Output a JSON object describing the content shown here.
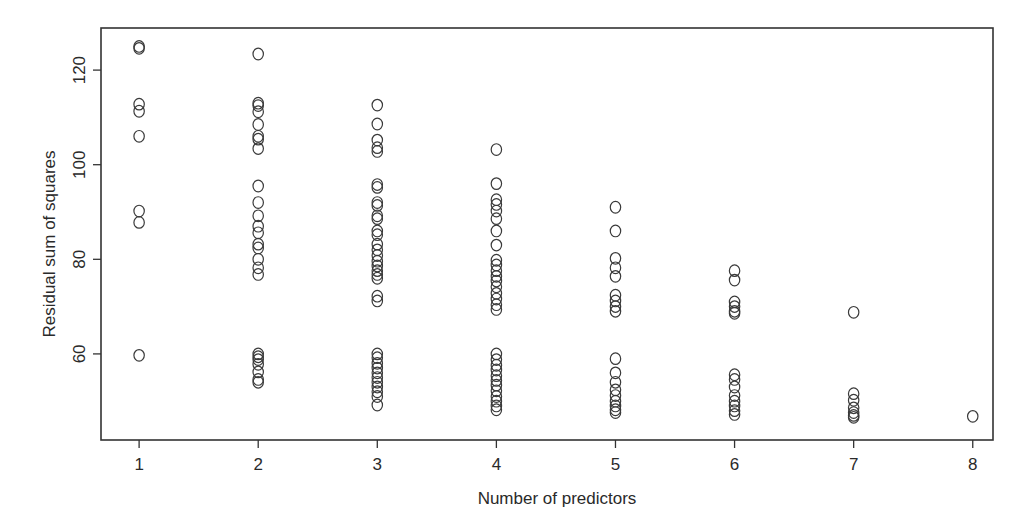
{
  "chart_data": {
    "type": "scatter",
    "title": "",
    "xlabel": "Number of predictors",
    "ylabel": "Residual sum of squares",
    "xlim": [
      0.68,
      8.17
    ],
    "ylim": [
      41.8,
      128.9
    ],
    "xticks": [
      1,
      2,
      3,
      4,
      5,
      6,
      7,
      8
    ],
    "yticks": [
      60,
      80,
      100,
      120
    ],
    "grid": false,
    "legend": "none",
    "marker": "open-circle",
    "series": [
      {
        "name": "models",
        "points": [
          {
            "x": 1,
            "y": 125.0
          },
          {
            "x": 1,
            "y": 124.6
          },
          {
            "x": 1,
            "y": 112.8
          },
          {
            "x": 1,
            "y": 111.3
          },
          {
            "x": 1,
            "y": 106.0
          },
          {
            "x": 1,
            "y": 90.2
          },
          {
            "x": 1,
            "y": 87.8
          },
          {
            "x": 1,
            "y": 59.7
          },
          {
            "x": 2,
            "y": 123.4
          },
          {
            "x": 2,
            "y": 113.0
          },
          {
            "x": 2,
            "y": 112.5
          },
          {
            "x": 2,
            "y": 111.2
          },
          {
            "x": 2,
            "y": 108.5
          },
          {
            "x": 2,
            "y": 106.0
          },
          {
            "x": 2,
            "y": 105.4
          },
          {
            "x": 2,
            "y": 103.4
          },
          {
            "x": 2,
            "y": 95.5
          },
          {
            "x": 2,
            "y": 92.0
          },
          {
            "x": 2,
            "y": 89.2
          },
          {
            "x": 2,
            "y": 87.0
          },
          {
            "x": 2,
            "y": 85.6
          },
          {
            "x": 2,
            "y": 83.2
          },
          {
            "x": 2,
            "y": 82.4
          },
          {
            "x": 2,
            "y": 80.0
          },
          {
            "x": 2,
            "y": 78.2
          },
          {
            "x": 2,
            "y": 76.8
          },
          {
            "x": 2,
            "y": 60.0
          },
          {
            "x": 2,
            "y": 59.4
          },
          {
            "x": 2,
            "y": 58.8
          },
          {
            "x": 2,
            "y": 57.8
          },
          {
            "x": 2,
            "y": 56.2
          },
          {
            "x": 2,
            "y": 54.6
          },
          {
            "x": 2,
            "y": 54.0
          },
          {
            "x": 3,
            "y": 112.6
          },
          {
            "x": 3,
            "y": 108.6
          },
          {
            "x": 3,
            "y": 105.2
          },
          {
            "x": 3,
            "y": 103.6
          },
          {
            "x": 3,
            "y": 102.8
          },
          {
            "x": 3,
            "y": 95.8
          },
          {
            "x": 3,
            "y": 95.2
          },
          {
            "x": 3,
            "y": 92.0
          },
          {
            "x": 3,
            "y": 91.4
          },
          {
            "x": 3,
            "y": 89.2
          },
          {
            "x": 3,
            "y": 88.6
          },
          {
            "x": 3,
            "y": 86.0
          },
          {
            "x": 3,
            "y": 85.2
          },
          {
            "x": 3,
            "y": 83.2
          },
          {
            "x": 3,
            "y": 82.0
          },
          {
            "x": 3,
            "y": 80.8
          },
          {
            "x": 3,
            "y": 79.6
          },
          {
            "x": 3,
            "y": 78.6
          },
          {
            "x": 3,
            "y": 77.6
          },
          {
            "x": 3,
            "y": 76.8
          },
          {
            "x": 3,
            "y": 76.0
          },
          {
            "x": 3,
            "y": 72.2
          },
          {
            "x": 3,
            "y": 71.2
          },
          {
            "x": 3,
            "y": 60.0
          },
          {
            "x": 3,
            "y": 59.2
          },
          {
            "x": 3,
            "y": 58.0
          },
          {
            "x": 3,
            "y": 57.0
          },
          {
            "x": 3,
            "y": 56.0
          },
          {
            "x": 3,
            "y": 55.0
          },
          {
            "x": 3,
            "y": 54.0
          },
          {
            "x": 3,
            "y": 53.0
          },
          {
            "x": 3,
            "y": 52.0
          },
          {
            "x": 3,
            "y": 51.0
          },
          {
            "x": 3,
            "y": 49.2
          },
          {
            "x": 4,
            "y": 103.2
          },
          {
            "x": 4,
            "y": 96.0
          },
          {
            "x": 4,
            "y": 92.6
          },
          {
            "x": 4,
            "y": 91.6
          },
          {
            "x": 4,
            "y": 90.2
          },
          {
            "x": 4,
            "y": 88.6
          },
          {
            "x": 4,
            "y": 86.0
          },
          {
            "x": 4,
            "y": 83.0
          },
          {
            "x": 4,
            "y": 79.8
          },
          {
            "x": 4,
            "y": 78.8
          },
          {
            "x": 4,
            "y": 77.6
          },
          {
            "x": 4,
            "y": 76.4
          },
          {
            "x": 4,
            "y": 75.4
          },
          {
            "x": 4,
            "y": 74.2
          },
          {
            "x": 4,
            "y": 72.8
          },
          {
            "x": 4,
            "y": 71.6
          },
          {
            "x": 4,
            "y": 70.4
          },
          {
            "x": 4,
            "y": 69.4
          },
          {
            "x": 4,
            "y": 60.0
          },
          {
            "x": 4,
            "y": 58.8
          },
          {
            "x": 4,
            "y": 57.6
          },
          {
            "x": 4,
            "y": 56.6
          },
          {
            "x": 4,
            "y": 55.4
          },
          {
            "x": 4,
            "y": 54.4
          },
          {
            "x": 4,
            "y": 53.4
          },
          {
            "x": 4,
            "y": 52.2
          },
          {
            "x": 4,
            "y": 51.0
          },
          {
            "x": 4,
            "y": 50.0
          },
          {
            "x": 4,
            "y": 49.0
          },
          {
            "x": 4,
            "y": 48.2
          },
          {
            "x": 5,
            "y": 91.0
          },
          {
            "x": 5,
            "y": 86.0
          },
          {
            "x": 5,
            "y": 80.2
          },
          {
            "x": 5,
            "y": 78.2
          },
          {
            "x": 5,
            "y": 76.4
          },
          {
            "x": 5,
            "y": 72.4
          },
          {
            "x": 5,
            "y": 71.2
          },
          {
            "x": 5,
            "y": 70.0
          },
          {
            "x": 5,
            "y": 69.0
          },
          {
            "x": 5,
            "y": 59.0
          },
          {
            "x": 5,
            "y": 56.0
          },
          {
            "x": 5,
            "y": 54.0
          },
          {
            "x": 5,
            "y": 52.4
          },
          {
            "x": 5,
            "y": 51.2
          },
          {
            "x": 5,
            "y": 50.0
          },
          {
            "x": 5,
            "y": 49.0
          },
          {
            "x": 5,
            "y": 48.2
          },
          {
            "x": 5,
            "y": 47.6
          },
          {
            "x": 6,
            "y": 77.6
          },
          {
            "x": 6,
            "y": 75.6
          },
          {
            "x": 6,
            "y": 71.0
          },
          {
            "x": 6,
            "y": 70.0
          },
          {
            "x": 6,
            "y": 69.0
          },
          {
            "x": 6,
            "y": 68.6
          },
          {
            "x": 6,
            "y": 55.6
          },
          {
            "x": 6,
            "y": 54.6
          },
          {
            "x": 6,
            "y": 53.0
          },
          {
            "x": 6,
            "y": 51.2
          },
          {
            "x": 6,
            "y": 50.0
          },
          {
            "x": 6,
            "y": 49.0
          },
          {
            "x": 6,
            "y": 48.0
          },
          {
            "x": 6,
            "y": 47.2
          },
          {
            "x": 7,
            "y": 68.8
          },
          {
            "x": 7,
            "y": 51.6
          },
          {
            "x": 7,
            "y": 50.2
          },
          {
            "x": 7,
            "y": 48.6
          },
          {
            "x": 7,
            "y": 47.6
          },
          {
            "x": 7,
            "y": 47.0
          },
          {
            "x": 7,
            "y": 46.6
          },
          {
            "x": 8,
            "y": 46.8
          }
        ]
      }
    ]
  }
}
